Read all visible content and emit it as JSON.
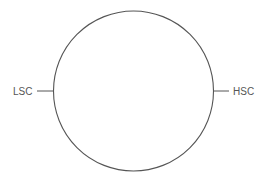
{
  "diagram": {
    "shape": "circle",
    "stroke_color": "#555555",
    "labels": {
      "left": "LSC",
      "right": "HSC"
    }
  }
}
